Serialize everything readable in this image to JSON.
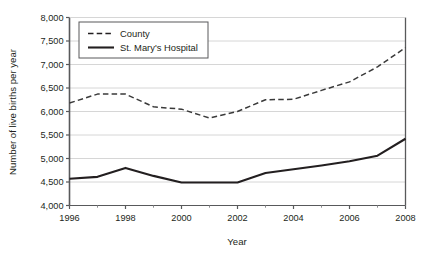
{
  "chart_data": {
    "type": "line",
    "title": "",
    "xlabel": "Year",
    "ylabel": "Number of live births per year",
    "xlim": [
      1996,
      2008
    ],
    "ylim": [
      4000,
      8000
    ],
    "grid": true,
    "legend_position": "top-left",
    "x": [
      1996,
      1997,
      1998,
      1999,
      2000,
      2001,
      2002,
      2003,
      2004,
      2005,
      2006,
      2007,
      2008
    ],
    "xticks": [
      1996,
      1998,
      2000,
      2002,
      2004,
      2006,
      2008
    ],
    "xtick_labels": [
      "1996",
      "1998",
      "2000",
      "2002",
      "2004",
      "2006",
      "2008"
    ],
    "xtick_minor": [
      1997,
      1999,
      2001,
      2003,
      2005,
      2007
    ],
    "yticks": [
      4000,
      4500,
      5000,
      5500,
      6000,
      6500,
      7000,
      7500,
      8000
    ],
    "ytick_labels": [
      "4,000",
      "4,500",
      "5,000",
      "5,500",
      "6,000",
      "6,500",
      "7,000",
      "7,500",
      "8,000"
    ],
    "series": [
      {
        "name": "County",
        "style": "dashed",
        "color": "#3a3a3a",
        "values": [
          6180,
          6370,
          6370,
          6100,
          6050,
          5860,
          6000,
          6250,
          6260,
          6450,
          6630,
          6950,
          7360
        ]
      },
      {
        "name": "St. Mary's Hospital",
        "style": "solid",
        "color": "#231f20",
        "values": [
          4570,
          4610,
          4800,
          4630,
          4490,
          4490,
          4490,
          4690,
          4770,
          4850,
          4940,
          5060,
          5420
        ]
      }
    ]
  },
  "legend": {
    "items": [
      {
        "label": "County",
        "style": "dashed"
      },
      {
        "label": "St. Mary's Hospital",
        "style": "solid"
      }
    ]
  }
}
